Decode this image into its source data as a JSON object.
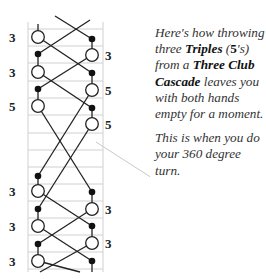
{
  "diagram": {
    "left_labels": [
      "3",
      "3",
      "5",
      "3",
      "3",
      "3"
    ],
    "right_labels": [
      "3",
      "5",
      "5",
      "3",
      "3"
    ],
    "colors": {
      "line": "#222222",
      "grid": "#d0d0d0",
      "pointer": "#c8c8c8"
    }
  },
  "caption": {
    "p1_a": "Here's how throwing three ",
    "p1_b": "Triples",
    "p1_c": " (",
    "p1_d": "5",
    "p1_e": "'s) from a ",
    "p1_f": "Three Club Cascade",
    "p1_g": " leaves you with both hands empty for a moment.",
    "p2": "This is when you do your 360 degree turn."
  }
}
